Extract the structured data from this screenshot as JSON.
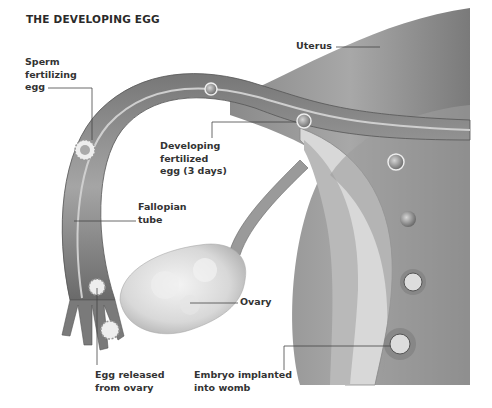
{
  "title": "THE DEVELOPING EGG",
  "labels": {
    "uterus": [
      "Uterus"
    ],
    "sperm": [
      "Sperm",
      "fertilizing",
      "egg"
    ],
    "developing": [
      "Developing",
      "fertilized",
      "egg (3 days)"
    ],
    "fallopian": [
      "Fallopian",
      "tube"
    ],
    "ovary": [
      "Ovary"
    ],
    "egg_released": [
      "Egg released",
      "from ovary"
    ],
    "embryo": [
      "Embryo implanted",
      "into womb"
    ]
  },
  "colors": {
    "text": "#333333",
    "leader_line": "#444444",
    "tissue_dark": "#6e6e6e",
    "tissue_mid": "#9a9a9a",
    "tissue_light": "#cfcfcf",
    "ovary": "#e2e2e2"
  }
}
